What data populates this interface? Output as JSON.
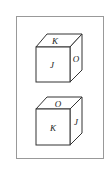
{
  "figure": {
    "frame": {
      "x": 16,
      "y": 16,
      "width": 88,
      "height": 143,
      "stroke": "#888888"
    },
    "cubes": [
      {
        "name": "top-cube",
        "faces": {
          "top": "K",
          "front": "J",
          "right": "O"
        }
      },
      {
        "name": "bottom-cube",
        "faces": {
          "top": "O",
          "front": "K",
          "right": "J"
        }
      }
    ]
  }
}
